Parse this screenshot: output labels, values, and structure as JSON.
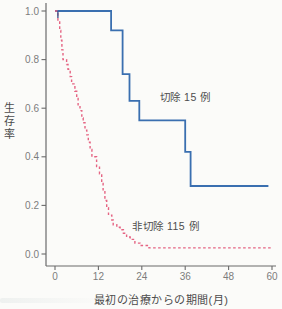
{
  "figure": {
    "background": "#fbfbf9",
    "axis_color": "#6b6b6b",
    "tick_label_color": "#7d7d7d",
    "text_color": "#4c4c4c",
    "accent_blue": "#3a6fb0",
    "accent_pink": "#e56483"
  },
  "chart_data": {
    "type": "line",
    "subtype": "kaplan-meier-step",
    "title": "",
    "xlabel": "最初の治療からの期間(月)",
    "ylabel": "生存率",
    "xlim": [
      0,
      60
    ],
    "ylim": [
      0.0,
      1.0
    ],
    "x_ticks": [
      "0",
      "12",
      "24",
      "36",
      "48",
      "60"
    ],
    "y_ticks": [
      "1.0",
      "0.8",
      "0.6",
      "0.4",
      "0.2",
      "0.0"
    ],
    "grid": false,
    "legend_position": "inline-annotations",
    "series": [
      {
        "name": "切除 15 例",
        "color": "#3a6fb0",
        "style": "solid",
        "stroke_width": 1.8,
        "points": [
          [
            0,
            1.0
          ],
          [
            15.5,
            0.92
          ],
          [
            18.7,
            0.74
          ],
          [
            20.6,
            0.63
          ],
          [
            23.3,
            0.55
          ],
          [
            36.0,
            0.42
          ],
          [
            37.5,
            0.28
          ],
          [
            59.0,
            0.28
          ]
        ]
      },
      {
        "name": "非切除 115 例",
        "color": "#e56483",
        "style": "dashed",
        "stroke_width": 1.4,
        "points": [
          [
            0,
            1.0
          ],
          [
            0.8,
            0.96
          ],
          [
            1.3,
            0.92
          ],
          [
            1.6,
            0.88
          ],
          [
            1.9,
            0.84
          ],
          [
            2.2,
            0.8
          ],
          [
            3.2,
            0.78
          ],
          [
            3.6,
            0.76
          ],
          [
            4.2,
            0.73
          ],
          [
            4.6,
            0.7
          ],
          [
            5.5,
            0.67
          ],
          [
            6.0,
            0.64
          ],
          [
            6.4,
            0.61
          ],
          [
            6.9,
            0.59
          ],
          [
            7.4,
            0.56
          ],
          [
            7.8,
            0.54
          ],
          [
            8.3,
            0.51
          ],
          [
            8.8,
            0.49
          ],
          [
            9.2,
            0.46
          ],
          [
            9.7,
            0.43
          ],
          [
            10.2,
            0.4
          ],
          [
            11.5,
            0.36
          ],
          [
            12.3,
            0.33
          ],
          [
            12.9,
            0.29
          ],
          [
            13.3,
            0.26
          ],
          [
            13.8,
            0.22
          ],
          [
            14.3,
            0.19
          ],
          [
            14.8,
            0.16
          ],
          [
            15.7,
            0.14
          ],
          [
            16.1,
            0.12
          ],
          [
            17.1,
            0.11
          ],
          [
            18.0,
            0.1
          ],
          [
            18.9,
            0.085
          ],
          [
            19.8,
            0.07
          ],
          [
            20.8,
            0.06
          ],
          [
            22.1,
            0.045
          ],
          [
            23.5,
            0.035
          ],
          [
            26.0,
            0.025
          ],
          [
            60.0,
            0.025
          ]
        ]
      }
    ],
    "annotations": [
      {
        "text": "切除 15 例",
        "x": 36.0,
        "y": 0.645,
        "anchor": "middle"
      },
      {
        "text": "非切除 115 例",
        "x": 21.3,
        "y": 0.115,
        "anchor": "start"
      }
    ],
    "censor_marks": [
      {
        "series": 0,
        "t": 0.8,
        "v": 1.0
      }
    ]
  }
}
